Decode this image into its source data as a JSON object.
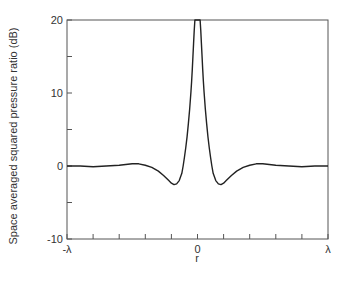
{
  "chart_data": {
    "type": "line",
    "title": "",
    "xlabel": "r",
    "ylabel": "Space averaged squared pressure ratio (dB)",
    "xlim": [
      -1,
      1
    ],
    "ylim": [
      -10,
      20
    ],
    "x_unit": "λ",
    "x_ticks": [
      -1,
      -0.8,
      -0.6,
      -0.4,
      -0.2,
      0,
      0.2,
      0.4,
      0.6,
      0.8,
      1
    ],
    "x_tick_labels": [
      {
        "value": -1,
        "label": "-λ"
      },
      {
        "value": 0,
        "label": "0"
      },
      {
        "value": 1,
        "label": "λ"
      }
    ],
    "y_ticks_major": [
      {
        "value": 20,
        "label": "20"
      },
      {
        "value": 10,
        "label": "10"
      },
      {
        "value": 0,
        "label": "0"
      },
      {
        "value": -10,
        "label": "-10"
      }
    ],
    "y_ticks_minor": [
      15,
      5,
      -5
    ],
    "grid": false,
    "legend": null,
    "series": [
      {
        "name": "space averaged squared pressure ratio",
        "color": "#222222",
        "x": [
          -1.0,
          -0.9,
          -0.8,
          -0.7,
          -0.6,
          -0.5,
          -0.45,
          -0.4,
          -0.35,
          -0.3,
          -0.26,
          -0.22,
          -0.2,
          -0.18,
          -0.16,
          -0.14,
          -0.12,
          -0.11,
          -0.1,
          -0.09,
          -0.08,
          -0.07,
          -0.06,
          -0.05,
          -0.045,
          -0.04,
          -0.035,
          -0.03,
          -0.025,
          -0.02,
          0.02,
          0.025,
          0.03,
          0.035,
          0.04,
          0.045,
          0.05,
          0.06,
          0.07,
          0.08,
          0.09,
          0.1,
          0.11,
          0.12,
          0.14,
          0.16,
          0.18,
          0.2,
          0.22,
          0.26,
          0.3,
          0.35,
          0.4,
          0.45,
          0.5,
          0.6,
          0.7,
          0.8,
          0.9,
          1.0
        ],
        "y": [
          0.0,
          0.0,
          -0.1,
          0.0,
          0.1,
          0.3,
          0.3,
          0.1,
          -0.2,
          -0.7,
          -1.3,
          -2.0,
          -2.35,
          -2.55,
          -2.45,
          -2.0,
          -1.0,
          0.0,
          1.2,
          2.5,
          4.0,
          5.8,
          7.8,
          10.2,
          11.6,
          13.2,
          15.0,
          16.8,
          18.6,
          20.0,
          20.0,
          18.6,
          16.8,
          15.0,
          13.2,
          11.6,
          10.2,
          7.8,
          5.8,
          4.0,
          2.5,
          1.2,
          0.0,
          -1.0,
          -2.0,
          -2.45,
          -2.55,
          -2.35,
          -2.0,
          -1.3,
          -0.7,
          -0.2,
          0.1,
          0.3,
          0.3,
          0.1,
          0.0,
          -0.1,
          0.0,
          0.0
        ]
      }
    ]
  }
}
